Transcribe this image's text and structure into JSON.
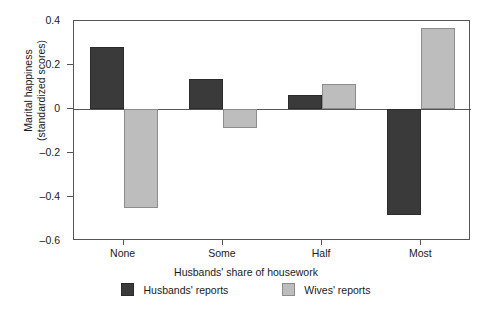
{
  "chart_data": {
    "type": "bar",
    "title": "",
    "subtitle": "",
    "xlabel": "Husbands' share of housework",
    "ylabel": "Marital happiness\n(standardized scores)",
    "ylabel_line1": "Marital happiness",
    "ylabel_line2": "(standardized scores)",
    "categories": [
      "None",
      "Some",
      "Half",
      "Most"
    ],
    "series": [
      {
        "name": "Husbands' reports",
        "color": "#3a3a3a",
        "values": [
          0.28,
          0.135,
          0.065,
          -0.48
        ]
      },
      {
        "name": "Wives' reports",
        "color": "#bdbdbd",
        "values": [
          -0.45,
          -0.085,
          0.115,
          0.37
        ]
      }
    ],
    "ylim": [
      -0.6,
      0.4
    ],
    "yticks": [
      0.4,
      0.2,
      0,
      -0.2,
      -0.4,
      -0.6
    ],
    "ytick_labels": [
      "0.4",
      "0.2",
      "0",
      "–0.2",
      "–0.4",
      "–0.6"
    ],
    "grid": false,
    "legend_position": "bottom",
    "zero_line": true
  },
  "legend": {
    "items": [
      {
        "label": "Husbands' reports",
        "swatch": "dark-square-swatch"
      },
      {
        "label": "Wives' reports",
        "swatch": "light-square-swatch"
      }
    ]
  }
}
